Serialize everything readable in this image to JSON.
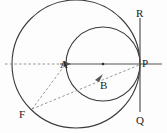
{
  "figure": {
    "width": 167,
    "height": 133,
    "background_color": "#fdfdfd",
    "stroke_color": "#2b2b2b",
    "dashed_color": "#8a8a8a",
    "axis_color": "#555555",
    "labels": {
      "A": "A",
      "B": "B",
      "P": "P",
      "Q": "Q",
      "R": "R",
      "F": "F"
    },
    "points": {
      "A": {
        "x": 66,
        "y": 64,
        "label_x": 63,
        "label_y": 68
      },
      "B": {
        "x": 103,
        "y": 64,
        "label_x": 103,
        "label_y": 88
      },
      "P": {
        "x": 140,
        "y": 64,
        "label_x": 141,
        "label_y": 66
      },
      "Q": {
        "x": 140,
        "y": 112,
        "label_x": 135,
        "label_y": 123
      },
      "R": {
        "x": 140,
        "y": 18,
        "label_x": 135,
        "label_y": 17
      },
      "F": {
        "x": 32,
        "y": 109,
        "label_x": 20,
        "label_y": 117
      }
    },
    "circles": [
      {
        "name": "outer-circle",
        "cx": 76,
        "cy": 64,
        "r": 64
      },
      {
        "name": "inner-circle",
        "cx": 103,
        "cy": 64,
        "r": 37
      }
    ],
    "lines": {
      "horizontal_axis": {
        "x1": 5,
        "y1": 64,
        "x2": 162,
        "y2": 64
      },
      "vertical_axis": {
        "x1": 140,
        "y1": 18,
        "x2": 140,
        "y2": 112
      },
      "dash_left": {
        "x1": 5,
        "y1": 64,
        "x2": 66,
        "y2": 64
      },
      "dash_F_to_A": {
        "x1": 32,
        "y1": 109,
        "x2": 66,
        "y2": 64
      },
      "dash_F_to_P": {
        "x1": 32,
        "y1": 109,
        "x2": 140,
        "y2": 64
      }
    }
  }
}
